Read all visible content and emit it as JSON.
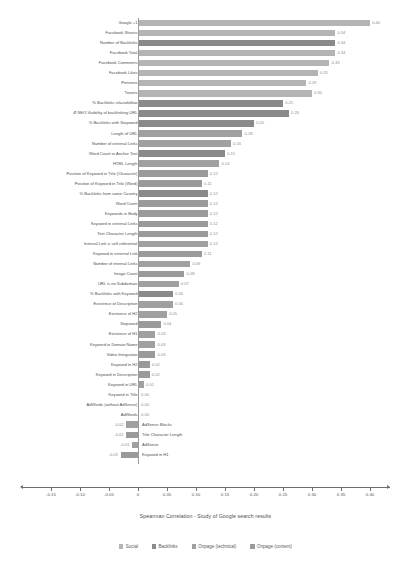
{
  "chart_data": {
    "type": "bar",
    "orientation": "horizontal",
    "title": "",
    "caption": "Spearman Correlation - Study of Google search results",
    "xlabel": "",
    "ylabel": "",
    "xlim": [
      -0.155,
      0.425
    ],
    "grid": false,
    "xticks": [
      -0.15,
      -0.1,
      -0.05,
      0,
      0.05,
      0.1,
      0.15,
      0.2,
      0.25,
      0.3,
      0.35,
      0.4
    ],
    "xticklabels": [
      "-0.15",
      "-0.10",
      "-0.05",
      "0",
      "0.05",
      "0.10",
      "0.15",
      "0.20",
      "0.25",
      "0.30",
      "0.35",
      "0.40"
    ],
    "legend_position": "bottom",
    "legend": [
      {
        "name": "Social",
        "color": "#b4b4b4"
      },
      {
        "name": "Backlinks",
        "color": "#8a8a8a"
      },
      {
        "name": "Onpage (technical)",
        "color": "#a0a0a0"
      },
      {
        "name": "Onpage (content)",
        "color": "#9a9a9a"
      }
    ],
    "categories": [
      "Google +1",
      "Facebook Shares",
      "Number of Backlinks",
      "Facebook Total",
      "Facebook Comments",
      "Facebook Likes",
      "Pinterest",
      "Tweets",
      "% Backlinks rel=nofollow",
      "Ø SEO-Visibility of backlinking URL",
      "% Backlinks with Stopword",
      "Length of URL",
      "Number of external Links",
      "Word Count in Anchor Text",
      "HTML Length",
      "Position of Keyword in Title (Character)",
      "Position of Keyword in Title (Word)",
      "% Backlinks from same Country",
      "Word Count",
      "Keywords in Body",
      "Keyword in external Links",
      "Text Character Length",
      "Internal Link is self-referential",
      "Keyword in external Link",
      "Number of internal Links",
      "Image Count",
      "URL is no Subdomain",
      "% Backlinks with Keyword",
      "Existence of Description",
      "Existence of H2",
      "Stopword",
      "Existence of H1",
      "Keyword in Domain Name",
      "Video Integration",
      "Keyword in H2",
      "Keyword in Description",
      "Keyword in URL",
      "Keyword in Title",
      "AdWords (without AdSense)",
      "AdWords",
      "AdSense Blocks",
      "Title Character Length",
      "AdSense",
      "Keyword in H1"
    ],
    "values": [
      0.4,
      0.34,
      0.34,
      0.34,
      0.33,
      0.31,
      0.29,
      0.3,
      0.25,
      0.26,
      0.2,
      0.18,
      0.16,
      0.15,
      0.14,
      0.12,
      0.11,
      0.12,
      0.12,
      0.12,
      0.12,
      0.12,
      0.12,
      0.11,
      0.09,
      0.08,
      0.07,
      0.06,
      0.06,
      0.05,
      0.04,
      0.03,
      0.03,
      0.03,
      0.02,
      0.02,
      0.01,
      0.0,
      0.0,
      0.0,
      -0.02,
      -0.02,
      -0.01,
      -0.03
    ],
    "value_labels": [
      "0.40",
      "0.34",
      "0.34",
      "0.34",
      "0.33",
      "0.31",
      "0.29",
      "0.30",
      "0.25",
      "0.26",
      "0.20",
      "0.18",
      "0.16",
      "0.15",
      "0.14",
      "0.12",
      "0.11",
      "0.12",
      "0.12",
      "0.12",
      "0.12",
      "0.12",
      "0.12",
      "0.11",
      "0.09",
      "0.08",
      "0.07",
      "0.06",
      "0.06",
      "0.05",
      "0.04",
      "0.03",
      "0.03",
      "0.03",
      "0.02",
      "0.02",
      "0.01",
      "0.00",
      "0.00",
      "0.00",
      "-0.02",
      "-0.02",
      "-0.01",
      "-0.03"
    ],
    "series_of": [
      "social",
      "social",
      "backlinks",
      "social",
      "social",
      "social",
      "social",
      "social",
      "backlinks",
      "backlinks",
      "backlinks",
      "tech",
      "tech",
      "backlinks",
      "tech",
      "content",
      "content",
      "backlinks",
      "content",
      "content",
      "content",
      "content",
      "tech",
      "content",
      "tech",
      "content",
      "tech",
      "backlinks",
      "tech",
      "tech",
      "content",
      "tech",
      "tech",
      "content",
      "content",
      "content",
      "tech",
      "content",
      "tech",
      "tech",
      "tech",
      "content",
      "tech",
      "content"
    ]
  }
}
